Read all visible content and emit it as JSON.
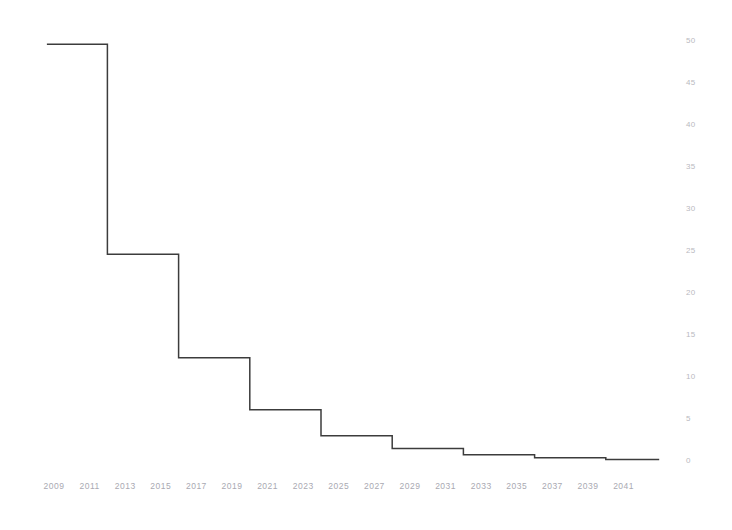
{
  "chart_data": {
    "type": "line",
    "line_style": "step-post",
    "title": "",
    "subtitle": "",
    "xlabel": "",
    "ylabel": "",
    "xlim": [
      2008.5,
      2043.0
    ],
    "ylim": [
      0,
      50
    ],
    "grid": false,
    "legend": null,
    "legend_position": "none",
    "annotations": [],
    "x_tick_labels": [
      "2009",
      "2011",
      "2013",
      "2015",
      "2017",
      "2019",
      "2021",
      "2023",
      "2025",
      "2027",
      "2029",
      "2031",
      "2033",
      "2035",
      "2037",
      "2039",
      "2041"
    ],
    "x_tick_values": [
      2009,
      2011,
      2013,
      2015,
      2017,
      2019,
      2021,
      2023,
      2025,
      2027,
      2029,
      2031,
      2033,
      2035,
      2037,
      2039,
      2041
    ],
    "y_tick_labels": [
      "0",
      "5",
      "10",
      "15",
      "20",
      "25",
      "30",
      "35",
      "40",
      "45",
      "50"
    ],
    "y_tick_values": [
      0,
      5,
      10,
      15,
      20,
      25,
      30,
      35,
      40,
      45,
      50
    ],
    "series": [
      {
        "name": "decay",
        "color": "#3c3c3c",
        "line_width": 1.5,
        "x": [
          2008.6,
          2012.0,
          2016.0,
          2020.0,
          2024.0,
          2028.0,
          2032.0,
          2036.0,
          2040.0,
          2043.0
        ],
        "values": [
          49.6,
          24.6,
          12.3,
          6.1,
          3.0,
          1.5,
          0.75,
          0.4,
          0.18,
          0.18
        ],
        "steps": [
          {
            "x_start": 2008.6,
            "x_end": 2012.0,
            "y": 49.6
          },
          {
            "x_start": 2012.0,
            "x_end": 2016.0,
            "y": 24.6
          },
          {
            "x_start": 2016.0,
            "x_end": 2020.0,
            "y": 12.3
          },
          {
            "x_start": 2020.0,
            "x_end": 2024.0,
            "y": 6.1
          },
          {
            "x_start": 2024.0,
            "x_end": 2028.0,
            "y": 3.0
          },
          {
            "x_start": 2028.0,
            "x_end": 2032.0,
            "y": 1.5
          },
          {
            "x_start": 2032.0,
            "x_end": 2036.0,
            "y": 0.75
          },
          {
            "x_start": 2036.0,
            "x_end": 2040.0,
            "y": 0.4
          },
          {
            "x_start": 2040.0,
            "x_end": 2043.0,
            "y": 0.18
          }
        ]
      }
    ]
  },
  "axes": {
    "y_tick_color": "#b9b9c0",
    "x_tick_color": "#a9a9b2",
    "line_color": "#3c3c3c",
    "background_color": "#ffffff"
  }
}
